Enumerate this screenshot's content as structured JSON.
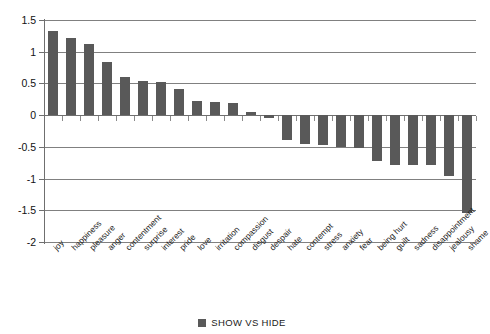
{
  "chart_data": {
    "type": "bar",
    "title": "",
    "xlabel": "",
    "ylabel": "",
    "ylim": [
      -2,
      1.5
    ],
    "yticks": [
      1.5,
      1,
      0.5,
      0,
      -0.5,
      -1,
      -1.5,
      -2
    ],
    "ytick_labels": [
      "1.5",
      "1",
      "0.5",
      "0",
      "-0.5",
      "-1",
      "-1.5",
      "-2"
    ],
    "grid": true,
    "legend_position": "bottom",
    "series_color": "#595959",
    "categories": [
      "joy",
      "happiness",
      "pleasure",
      "anger",
      "contentment",
      "surprise",
      "interest",
      "pride",
      "love",
      "irritation",
      "compassion",
      "disgust",
      "despair",
      "hate",
      "contempt",
      "stress",
      "anxiety",
      "fear",
      "being hurt",
      "guilt",
      "sadness",
      "disappointment",
      "jealousy",
      "shame"
    ],
    "series": [
      {
        "name": "SHOW VS HIDE",
        "values": [
          1.32,
          1.21,
          1.12,
          0.83,
          0.6,
          0.54,
          0.52,
          0.42,
          0.23,
          0.21,
          0.19,
          0.05,
          -0.04,
          -0.39,
          -0.46,
          -0.47,
          -0.5,
          -0.52,
          -0.73,
          -0.78,
          -0.79,
          -0.79,
          -0.96,
          -1.55
        ]
      }
    ]
  },
  "legend": {
    "label": "SHOW VS HIDE"
  }
}
